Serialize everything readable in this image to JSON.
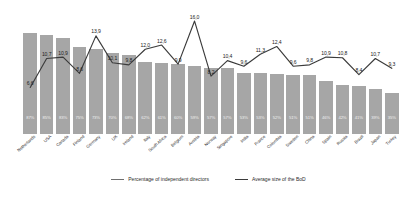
{
  "chart_data": {
    "type": "bar",
    "title": "",
    "xlabel": "",
    "ylabel": "",
    "grid": false,
    "legend_position": "bottom",
    "categories": [
      "Netherlands",
      "USA",
      "Canada",
      "Finland",
      "Germany",
      "UK",
      "Ireland",
      "Italy",
      "South Africa",
      "Belgium",
      "Austria",
      "Norway",
      "Singapore",
      "India",
      "France",
      "Colombia",
      "Sweden",
      "China",
      "Spain",
      "Russia",
      "Brazil",
      "Japan",
      "Turkey"
    ],
    "series": [
      {
        "name": "Percentage of independent directors",
        "type": "bar",
        "unit": "%",
        "values": [
          87,
          85,
          83,
          75,
          73,
          70,
          68,
          62,
          61,
          60,
          59,
          57,
          57,
          53,
          53,
          52,
          51,
          51,
          46,
          42,
          41,
          39,
          35
        ],
        "labels": [
          "87%",
          "85%",
          "83%",
          "75%",
          "73%",
          "70%",
          "68%",
          "62%",
          "61%",
          "60%",
          "59%",
          "57%",
          "57%",
          "53%",
          "53%",
          "52%",
          "51%",
          "51%",
          "46%",
          "42%",
          "41%",
          "39%",
          "35%"
        ],
        "color": "#a6a6a6"
      },
      {
        "name": "Average size of the BoD",
        "type": "line",
        "values": [
          6.6,
          10.7,
          10.9,
          8.6,
          13.9,
          10.1,
          9.8,
          12.0,
          12.6,
          9.9,
          16.0,
          8.2,
          10.4,
          9.6,
          11.3,
          12.4,
          9.6,
          9.8,
          10.9,
          10.8,
          8.4,
          10.7,
          9.3
        ],
        "labels": [
          "6,6",
          "10,7",
          "10,9",
          "8,6",
          "13,9",
          "10,1",
          "9,8",
          "12,0",
          "12,6",
          "9,9",
          "16,0",
          "8,2",
          "10,4",
          "9,6",
          "11,3",
          "12,4",
          "9,6",
          "9,8",
          "10,9",
          "10,8",
          "8,4",
          "10,7",
          "9,3"
        ],
        "color": "#3b3b3b"
      }
    ],
    "ylim_bars": [
      0,
      100
    ],
    "ylim_line": [
      0,
      17
    ]
  },
  "legend": {
    "items": [
      {
        "label": "Percentage of independent directors"
      },
      {
        "label": "Average size of the BoD"
      }
    ]
  }
}
